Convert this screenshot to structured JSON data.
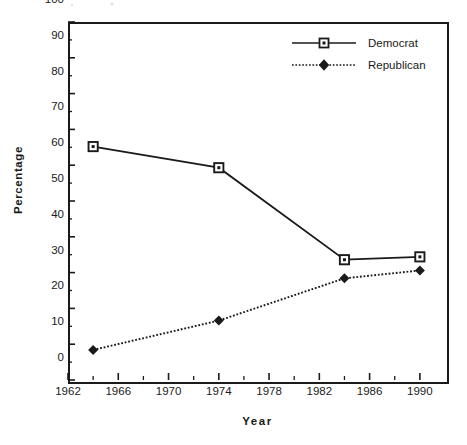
{
  "chart_data": {
    "type": "line",
    "title": "",
    "xlabel": "Year",
    "ylabel": "Percentage",
    "xlim": [
      1962,
      1992
    ],
    "ylim": [
      0,
      100
    ],
    "xticks": [
      1962,
      1966,
      1970,
      1974,
      1978,
      1982,
      1986,
      1990
    ],
    "xtick_labels": [
      "1962",
      "1966",
      "1970",
      "1974",
      "1978",
      "1982",
      "1986",
      "1990"
    ],
    "x_minor_tick_interval": 2,
    "yticks": [
      0,
      10,
      20,
      30,
      40,
      50,
      60,
      70,
      80,
      90,
      100
    ],
    "ytick_labels": [
      "0",
      "10",
      "20",
      "30",
      "40",
      "50",
      "60",
      "70",
      "80",
      "90",
      "100"
    ],
    "y_minor_tick_interval": 5,
    "grid": false,
    "legend_position": "top-right",
    "x": [
      1964,
      1974,
      1984,
      1990
    ],
    "series": [
      {
        "name": "Democrat",
        "values": [
          65.2,
          59.3,
          33.6,
          34.4
        ],
        "line_style": "solid",
        "marker": "open-square",
        "color": "#1a1a1a"
      },
      {
        "name": "Republican",
        "values": [
          8.4,
          16.6,
          28.4,
          30.6
        ],
        "line_style": "dotted",
        "marker": "filled-diamond",
        "color": "#1a1a1a"
      }
    ]
  },
  "axes": {
    "y_title": "Percentage",
    "x_title": "Year"
  },
  "legend": {
    "items": [
      {
        "label": "Democrat",
        "style": "solid-line-open-square"
      },
      {
        "label": "Republican",
        "style": "dotted-line-filled-diamond"
      }
    ]
  }
}
